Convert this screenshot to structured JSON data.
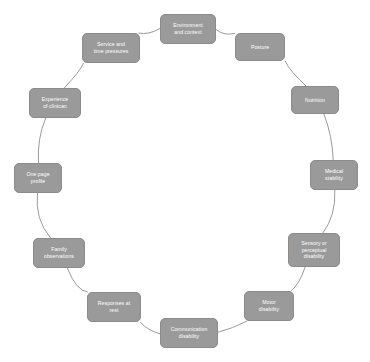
{
  "diagram": {
    "type": "cycle",
    "background_color": "#ffffff",
    "node_fill_color": "#9a9a9a",
    "node_border_color": "#8b8b8b",
    "node_text_color": "#ffffff",
    "connector_color": "#8f8f8f",
    "center": {
      "x": 185,
      "y": 183
    },
    "radius": 150,
    "node_count": 12,
    "nodes": [
      {
        "id": "environment-and-context",
        "label": "Environment\nand context",
        "x": 160,
        "y": 14,
        "w": 56,
        "h": 30
      },
      {
        "id": "posture",
        "label": "Posture",
        "x": 235,
        "y": 33,
        "w": 50,
        "h": 28
      },
      {
        "id": "nutrition",
        "label": "Nutrition",
        "x": 291,
        "y": 86,
        "w": 48,
        "h": 28
      },
      {
        "id": "medical-stability",
        "label": "Medical\nstability",
        "x": 310,
        "y": 160,
        "w": 48,
        "h": 30
      },
      {
        "id": "sensory-or-perceptual-disability",
        "label": "Sensory or\nperceptual\ndisability",
        "x": 288,
        "y": 233,
        "w": 52,
        "h": 34
      },
      {
        "id": "motor-disability",
        "label": "Motor\ndisability",
        "x": 244,
        "y": 291,
        "w": 50,
        "h": 30
      },
      {
        "id": "communication-disability",
        "label": "Communication\ndisability",
        "x": 160,
        "y": 318,
        "w": 58,
        "h": 30
      },
      {
        "id": "responses-at-rest",
        "label": "Responses at\nrest",
        "x": 87,
        "y": 292,
        "w": 54,
        "h": 30
      },
      {
        "id": "family-observations",
        "label": "Family\nobservations",
        "x": 33,
        "y": 238,
        "w": 52,
        "h": 30
      },
      {
        "id": "one-page-profile",
        "label": "One page\nprofile",
        "x": 14,
        "y": 163,
        "w": 48,
        "h": 30
      },
      {
        "id": "experience-of-clinician",
        "label": "Experience\nof clinican",
        "x": 29,
        "y": 88,
        "w": 52,
        "h": 30
      },
      {
        "id": "service-and-time-pressures",
        "label": "Service and\ntime pressures",
        "x": 82,
        "y": 33,
        "w": 58,
        "h": 30
      }
    ]
  }
}
